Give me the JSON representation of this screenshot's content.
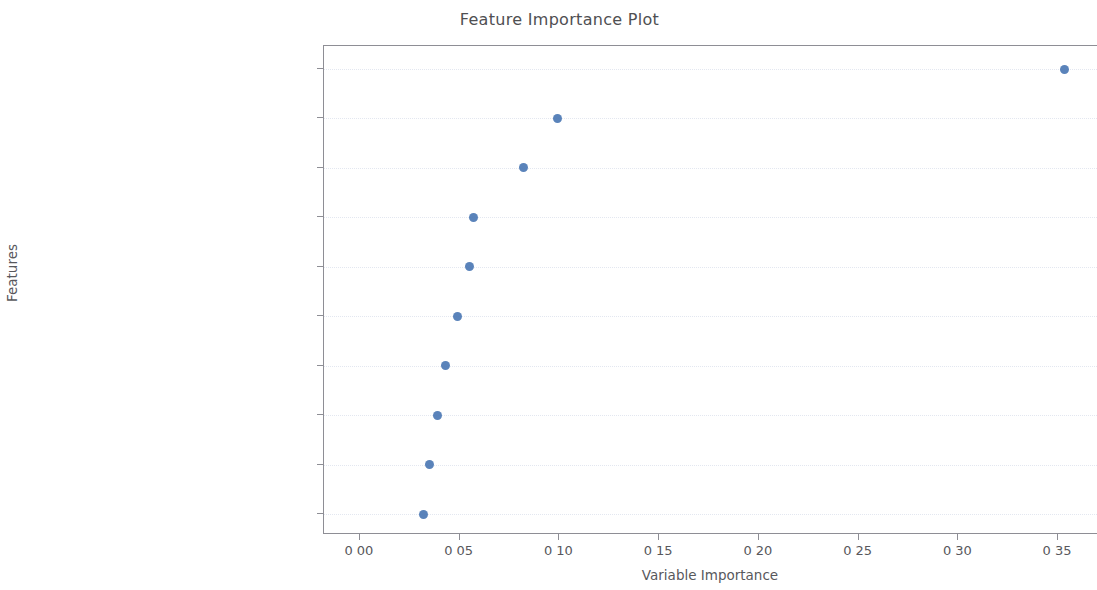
{
  "chart_data": {
    "type": "scatter",
    "title": "Feature Importance Plot",
    "xlabel": "Variable Importance",
    "ylabel": "Features",
    "grid": true,
    "legend": null,
    "xlim": [
      -0.018,
      0.37
    ],
    "xticks": [
      0.0,
      0.05,
      0.1,
      0.15,
      0.2,
      0.25,
      0.3,
      0.35
    ],
    "xticklabels": [
      "0 00",
      "0 05",
      "0 10",
      "0 15",
      "0 20",
      "0 25",
      "0 30",
      "0 35"
    ],
    "marker_color": "#4c78b4",
    "categories": [
      "thal_3",
      "number of major vessels _0",
      "chest pain type_4",
      "thal_7",
      "exercise induced angina  _0",
      "slope of peak_2",
      "slope of peak_1",
      "sex_0",
      "maximum heart rate achieved",
      "oldpeak"
    ],
    "values": [
      0.353,
      0.099,
      0.082,
      0.057,
      0.055,
      0.049,
      0.043,
      0.039,
      0.035,
      0.032
    ],
    "points": [
      {
        "label": "thal_3",
        "value": 0.353
      },
      {
        "label": "number of major vessels _0",
        "value": 0.099
      },
      {
        "label": "chest pain type_4",
        "value": 0.082
      },
      {
        "label": "thal_7",
        "value": 0.057
      },
      {
        "label": "exercise induced angina  _0",
        "value": 0.055
      },
      {
        "label": "slope of peak_2",
        "value": 0.049
      },
      {
        "label": "slope of peak_1",
        "value": 0.043
      },
      {
        "label": "sex_0",
        "value": 0.039
      },
      {
        "label": "maximum heart rate achieved",
        "value": 0.035
      },
      {
        "label": "oldpeak",
        "value": 0.032
      }
    ]
  }
}
